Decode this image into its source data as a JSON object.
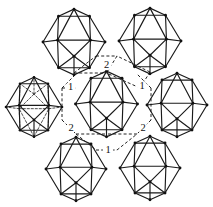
{
  "figure": {
    "type": "structure-diagram",
    "background_color": "#ffffff",
    "line_color": "#1a1a1a",
    "width": 213,
    "height": 207
  },
  "clusters": [
    {
      "id": "center",
      "name": "central-icosahedron",
      "cx": 106.5,
      "cy": 104.0,
      "r": 31.0,
      "style": "solid",
      "show_hidden_edges": false
    },
    {
      "id": "top-left",
      "name": "top-left-icosahedron",
      "cx": 74.0,
      "cy": 42.0,
      "r": 31.0,
      "style": "solid",
      "show_hidden_edges": false
    },
    {
      "id": "top-right",
      "name": "top-right-icosahedron",
      "cx": 150.0,
      "cy": 41.0,
      "r": 31.0,
      "style": "solid",
      "show_hidden_edges": false
    },
    {
      "id": "left",
      "name": "left-icosahedron-wireframe",
      "cx": 34.0,
      "cy": 107.0,
      "r": 28.0,
      "style": "wireframe",
      "show_hidden_edges": true
    },
    {
      "id": "right",
      "name": "right-icosahedron",
      "cx": 177.0,
      "cy": 105.0,
      "r": 30.0,
      "style": "solid",
      "show_hidden_edges": false
    },
    {
      "id": "bottom-left",
      "name": "bottom-left-icosahedron",
      "cx": 76.0,
      "cy": 169.0,
      "r": 30.0,
      "style": "solid",
      "show_hidden_edges": false
    },
    {
      "id": "bottom-right",
      "name": "bottom-right-icosahedron",
      "cx": 150.0,
      "cy": 168.0,
      "r": 30.0,
      "style": "solid",
      "show_hidden_edges": false
    }
  ],
  "link_labels": [
    {
      "id": "label-top-center",
      "text": "2",
      "x": 106.5,
      "y": 65.0
    },
    {
      "id": "label-upper-left",
      "text": "1",
      "x": 70.5,
      "y": 87.0
    },
    {
      "id": "label-upper-right",
      "text": "1",
      "x": 142.0,
      "y": 86.0
    },
    {
      "id": "label-lower-left",
      "text": "2",
      "x": 71.0,
      "y": 128.0
    },
    {
      "id": "label-lower-right",
      "text": "2",
      "x": 143.0,
      "y": 128.0
    },
    {
      "id": "label-bottom-center",
      "text": "1",
      "x": 108.0,
      "y": 150.0
    }
  ],
  "link_paths": [
    {
      "id": "link-tl-c-a",
      "points": "74,73 106.5,73"
    },
    {
      "id": "link-tl-c-b",
      "points": "74,73 96,56"
    },
    {
      "id": "link-tl-c-c",
      "points": "96,56 117,56"
    },
    {
      "id": "link-tl-c-d",
      "points": "117,56 106.5,73"
    },
    {
      "id": "link-tr-c-a",
      "points": "150,72 117,56"
    },
    {
      "id": "link-tr-c-b",
      "points": "150,72 140,88"
    },
    {
      "id": "link-tr-c-c",
      "points": "140,88 106.5,73"
    },
    {
      "id": "link-l-c-a",
      "points": "62,88 76,74"
    },
    {
      "id": "link-l-c-b",
      "points": "62,88 62,120"
    },
    {
      "id": "link-l-c-c",
      "points": "62,120 76,134"
    },
    {
      "id": "link-l-c-d",
      "points": "62,88 76,88"
    },
    {
      "id": "link-r-c-a",
      "points": "151,88 137,74"
    },
    {
      "id": "link-r-c-b",
      "points": "151,88 151,120"
    },
    {
      "id": "link-r-c-c",
      "points": "151,120 137,134"
    },
    {
      "id": "link-bl-c-a",
      "points": "76,134 96,150"
    },
    {
      "id": "link-bl-c-b",
      "points": "96,150 117,150"
    },
    {
      "id": "link-bl-c-c",
      "points": "117,150 137,134"
    },
    {
      "id": "link-bl-c-d",
      "points": "76,134 106.5,134"
    },
    {
      "id": "link-br-c-a",
      "points": "137,134 106.5,134"
    }
  ]
}
